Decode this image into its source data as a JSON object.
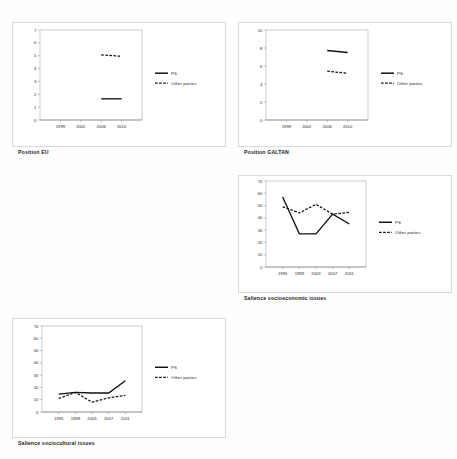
{
  "page": {
    "background": "#fefefe",
    "series_colors": {
      "ps": "#111111",
      "other": "#111111"
    }
  },
  "legend": {
    "ps_label": "PS",
    "other_label": "Other parties"
  },
  "figures": [
    {
      "id": "position-eu",
      "caption": "Position EU"
    },
    {
      "id": "position-galtan",
      "caption": "Position GALTAN"
    },
    {
      "id": "salience-econ",
      "caption": "Salience socioeconomic issues"
    },
    {
      "id": "salience-cult",
      "caption": "Salience sociocultural issues"
    }
  ],
  "chart_data": [
    {
      "id": "position-eu",
      "type": "line",
      "title": "Position EU",
      "xlabel": "",
      "ylabel": "",
      "x": [
        "1999",
        "2002",
        "2006",
        "2010"
      ],
      "xlim": [
        0,
        5
      ],
      "ylim": [
        0,
        7
      ],
      "yticks": [
        0,
        1,
        2,
        3,
        4,
        5,
        6,
        7
      ],
      "grid": false,
      "legend": "right",
      "series": [
        {
          "name": "PS",
          "style": "solid",
          "x": [
            "2006",
            "2010"
          ],
          "values": [
            1.65,
            1.65
          ]
        },
        {
          "name": "Other parties",
          "style": "dashed",
          "x": [
            "2006",
            "2010"
          ],
          "values": [
            5.07,
            4.95
          ]
        }
      ]
    },
    {
      "id": "position-galtan",
      "type": "line",
      "title": "Position GALTAN",
      "xlabel": "",
      "ylabel": "",
      "x": [
        "1999",
        "2002",
        "2006",
        "2010"
      ],
      "xlim": [
        0,
        5
      ],
      "ylim": [
        0,
        10
      ],
      "yticks": [
        0,
        2,
        4,
        6,
        8,
        10
      ],
      "grid": false,
      "legend": "right",
      "series": [
        {
          "name": "PS",
          "style": "solid",
          "x": [
            "2006",
            "2010"
          ],
          "values": [
            7.72,
            7.5
          ]
        },
        {
          "name": "Other parties",
          "style": "dashed",
          "x": [
            "2006",
            "2010"
          ],
          "values": [
            5.42,
            5.2
          ]
        }
      ]
    },
    {
      "id": "salience-econ",
      "type": "line",
      "title": "Salience socioeconomic issues",
      "xlabel": "",
      "ylabel": "",
      "x": [
        "1995",
        "1999",
        "2003",
        "2007",
        "2011"
      ],
      "xlim": [
        0,
        6
      ],
      "ylim": [
        0,
        70
      ],
      "yticks": [
        0,
        10,
        20,
        30,
        40,
        50,
        60,
        70
      ],
      "grid": false,
      "legend": "right",
      "series": [
        {
          "name": "PS",
          "style": "solid",
          "x": [
            "1995",
            "1999",
            "2003",
            "2007",
            "2011"
          ],
          "values": [
            57,
            27,
            27,
            43,
            35
          ]
        },
        {
          "name": "Other parties",
          "style": "dashed",
          "x": [
            "1995",
            "1999",
            "2003",
            "2007",
            "2011"
          ],
          "values": [
            49,
            44,
            51,
            43,
            44.5
          ]
        }
      ]
    },
    {
      "id": "salience-cult",
      "type": "line",
      "title": "Salience sociocultural issues",
      "xlabel": "",
      "ylabel": "",
      "x": [
        "1995",
        "1999",
        "2003",
        "2007",
        "2011"
      ],
      "xlim": [
        0,
        6
      ],
      "ylim": [
        0,
        70
      ],
      "yticks": [
        0,
        10,
        20,
        30,
        40,
        50,
        60,
        70
      ],
      "grid": false,
      "legend": "right",
      "series": [
        {
          "name": "PS",
          "style": "solid",
          "x": [
            "1995",
            "1999",
            "2003",
            "2007",
            "2011"
          ],
          "values": [
            14.5,
            16,
            15.5,
            15.5,
            25.5
          ]
        },
        {
          "name": "Other parties",
          "style": "dashed",
          "x": [
            "1995",
            "1999",
            "2003",
            "2007",
            "2011"
          ],
          "values": [
            11,
            16,
            8,
            11.5,
            13.5
          ]
        }
      ]
    }
  ]
}
